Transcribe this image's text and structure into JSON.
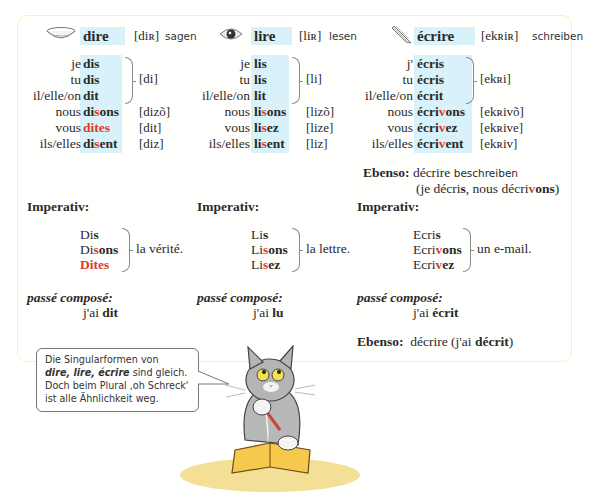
{
  "verbs": [
    {
      "infinitive": "dire",
      "phonetic": "[diʀ]",
      "translation": "sagen",
      "icon": "mouth-icon",
      "forms": [
        {
          "pronoun": "je",
          "stem": "di",
          "ending": "s",
          "stem_red": "",
          "phon": ""
        },
        {
          "pronoun": "tu",
          "stem": "di",
          "ending": "s",
          "stem_red": "",
          "phon": ""
        },
        {
          "pronoun": "il/elle/on",
          "stem": "di",
          "ending": "t",
          "stem_red": "",
          "phon": ""
        },
        {
          "pronoun": "nous",
          "stem": "di",
          "stem_red": "s",
          "ending": "ons",
          "phon": "[dizõ]"
        },
        {
          "pronoun": "vous",
          "stem": "",
          "stem_red": "dites",
          "ending": "",
          "phon": "[dit]"
        },
        {
          "pronoun": "ils/elles",
          "stem": "di",
          "stem_red": "s",
          "ending": "ent",
          "phon": "[diz]"
        }
      ],
      "singular_phon": "[di]",
      "imperativ_label": "Imperativ:",
      "imperativ": [
        {
          "stem": "Di",
          "stem_red": "",
          "ending": "s"
        },
        {
          "stem": "Di",
          "stem_red": "s",
          "ending": "ons"
        },
        {
          "stem": "",
          "stem_red": "Dites",
          "ending": ""
        }
      ],
      "imperativ_object": "la vérité.",
      "pc_label": "passé composé:",
      "pc_aux": "j'ai",
      "pc_participle": "dit"
    },
    {
      "infinitive": "lire",
      "phonetic": "[liʀ]",
      "translation": "lesen",
      "icon": "eye-icon",
      "forms": [
        {
          "pronoun": "je",
          "stem": "li",
          "ending": "s",
          "stem_red": "",
          "phon": ""
        },
        {
          "pronoun": "tu",
          "stem": "li",
          "ending": "s",
          "stem_red": "",
          "phon": ""
        },
        {
          "pronoun": "il/elle/on",
          "stem": "li",
          "ending": "t",
          "stem_red": "",
          "phon": ""
        },
        {
          "pronoun": "nous",
          "stem": "li",
          "stem_red": "s",
          "ending": "ons",
          "phon": "[lizõ]"
        },
        {
          "pronoun": "vous",
          "stem": "li",
          "stem_red": "s",
          "ending": "ez",
          "phon": "[lize]"
        },
        {
          "pronoun": "ils/elles",
          "stem": "li",
          "stem_red": "s",
          "ending": "ent",
          "phon": "[liz]"
        }
      ],
      "singular_phon": "[li]",
      "imperativ_label": "Imperativ:",
      "imperativ": [
        {
          "stem": "Li",
          "stem_red": "",
          "ending": "s"
        },
        {
          "stem": "Li",
          "stem_red": "s",
          "ending": "ons"
        },
        {
          "stem": "Li",
          "stem_red": "s",
          "ending": "ez"
        }
      ],
      "imperativ_object": "la lettre.",
      "pc_label": "passé composé:",
      "pc_aux": "j'ai",
      "pc_participle": "lu"
    },
    {
      "infinitive": "écrire",
      "phonetic": "[ekʀiʀ]",
      "translation": "schreiben",
      "icon": "pencil-icon",
      "forms": [
        {
          "pronoun": "j'",
          "stem": "écri",
          "ending": "s",
          "stem_red": "",
          "phon": ""
        },
        {
          "pronoun": "tu",
          "stem": "écri",
          "ending": "s",
          "stem_red": "",
          "phon": ""
        },
        {
          "pronoun": "il/elle/on",
          "stem": "écri",
          "ending": "t",
          "stem_red": "",
          "phon": ""
        },
        {
          "pronoun": "nous",
          "stem": "écri",
          "stem_red": "v",
          "ending": "ons",
          "phon": "[ekʀivõ]"
        },
        {
          "pronoun": "vous",
          "stem": "écri",
          "stem_red": "v",
          "ending": "ez",
          "phon": "[ekʀive]"
        },
        {
          "pronoun": "ils/elles",
          "stem": "écri",
          "stem_red": "v",
          "ending": "ent",
          "phon": "[ekʀiv]"
        }
      ],
      "singular_phon": "[ekʀi]",
      "ebenso1": {
        "label": "Ebenso:",
        "verb": "décrire",
        "translation": "beschreiben",
        "line2_a": "(je décri",
        "line2_b": "s",
        "line2_c": ", nous décri",
        "line2_d": "v",
        "line2_e": "ons",
        "line2_f": ")"
      },
      "imperativ_label": "Imperativ:",
      "imperativ": [
        {
          "stem": "Ecri",
          "stem_red": "",
          "ending": "s"
        },
        {
          "stem": "Ecri",
          "stem_red": "v",
          "ending": "ons"
        },
        {
          "stem": "Ecri",
          "stem_red": "v",
          "ending": "ez"
        }
      ],
      "imperativ_object": "un e-mail.",
      "pc_label": "passé composé:",
      "pc_aux": "j'ai",
      "pc_participle": "écrit",
      "ebenso2": {
        "label": "Ebenso:",
        "text_a": "décrire (j'ai ",
        "text_b": "décrit",
        "text_c": ")"
      }
    }
  ],
  "speech_bubble": {
    "line1": "Die Singularformen von",
    "line2_italic": "dire, lire, écrire",
    "line2_rest": " sind gleich.",
    "line3": "Doch beim Plural ‚oh Schreck'",
    "line4": "ist alle Ähnlichkeit weg."
  },
  "illustration": "cat-with-pencil-reading-book",
  "colors": {
    "highlight_bg": "#d9f1f8",
    "red_accent": "#e0392b",
    "box_border": "#f7f2b8"
  }
}
